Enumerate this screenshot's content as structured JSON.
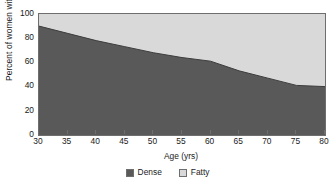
{
  "chart_data": {
    "type": "area",
    "title": "",
    "xlabel": "Age (yrs)",
    "ylabel": "Percent of women with pattern",
    "xlim": [
      30,
      80
    ],
    "ylim": [
      0,
      100
    ],
    "xticks": [
      30,
      35,
      40,
      45,
      50,
      55,
      60,
      65,
      70,
      75,
      80
    ],
    "yticks": [
      0,
      20,
      40,
      60,
      80,
      100
    ],
    "grid": false,
    "stacked": true,
    "legend_position": "bottom-center",
    "x": [
      30,
      35,
      40,
      45,
      50,
      55,
      60,
      65,
      70,
      75,
      80
    ],
    "series": [
      {
        "name": "Dense",
        "color": "#595959",
        "values": [
          90,
          84,
          78,
          73,
          68,
          64,
          61,
          53,
          47,
          41,
          40
        ]
      },
      {
        "name": "Fatty",
        "color": "#d9d9d9",
        "values": [
          10,
          16,
          22,
          27,
          32,
          36,
          39,
          47,
          53,
          59,
          60
        ]
      }
    ]
  },
  "axes": {
    "x_title": "Age (yrs)",
    "y_title": "Percent of women with pattern",
    "x_tick_labels": [
      "30",
      "35",
      "40",
      "45",
      "50",
      "55",
      "60",
      "65",
      "70",
      "75",
      "80"
    ],
    "y_tick_labels": [
      "0",
      "20",
      "40",
      "60",
      "80",
      "100"
    ]
  },
  "legend": {
    "items": [
      {
        "label": "Dense",
        "color": "#595959"
      },
      {
        "label": "Fatty",
        "color": "#d9d9d9"
      }
    ]
  },
  "colors": {
    "dense": "#595959",
    "fatty": "#d9d9d9",
    "frame": "#6e6e6e",
    "text": "#1a1a1a",
    "background": "#ffffff"
  }
}
